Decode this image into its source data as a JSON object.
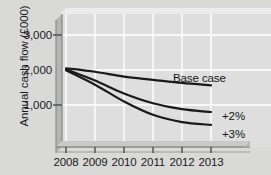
{
  "chart_data": {
    "type": "line",
    "title": "",
    "xlabel": "",
    "ylabel": "Annual cash flow (£000)",
    "categories": [
      "2008",
      "2009",
      "2010",
      "2011",
      "2012",
      "2013"
    ],
    "x": [
      2008,
      2009,
      2010,
      2011,
      2012,
      2013
    ],
    "ylim": [
      0,
      3400
    ],
    "xlim": [
      2008,
      2013
    ],
    "y_ticks": [
      1000,
      2000,
      3000
    ],
    "y_tick_labels": [
      "1,000",
      "2,000",
      "3,000"
    ],
    "grid": true,
    "legend_position": "inline-right",
    "series": [
      {
        "name": "Base case",
        "label": "Base case",
        "values": [
          2050,
          1950,
          1810,
          1720,
          1630,
          1560
        ],
        "color": "#1a1a1a"
      },
      {
        "name": "+2%",
        "label": "+2%",
        "values": [
          2020,
          1700,
          1330,
          1050,
          880,
          800
        ],
        "color": "#1a1a1a"
      },
      {
        "name": "+3%",
        "label": "+3%",
        "values": [
          1990,
          1580,
          1100,
          720,
          510,
          430
        ],
        "color": "#1a1a1a"
      }
    ]
  },
  "figure": {
    "background_color": "#d9d9d7",
    "plot_background_color": "#dedede",
    "gridline_color": "#ffffff",
    "axis_color": "#6e6e6e",
    "line_color": "#1a1a1a"
  }
}
